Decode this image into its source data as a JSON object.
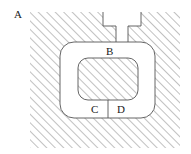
{
  "figure": {
    "kind": "engineering-cross-section-diagram",
    "canvas": {
      "width": 191,
      "height": 154
    },
    "background_color": "#ffffff",
    "line_color": "#555555",
    "hatch_color": "#8c8c8c",
    "text_color": "#1a1a1a",
    "labels": {
      "a": "A",
      "b": "B",
      "c": "C",
      "d": "D"
    },
    "regions": {
      "outer_hatched_block": {
        "name": "A",
        "x": 30,
        "y": 12,
        "width": 150,
        "height": 136,
        "fill": "diagonal-hatch-45"
      },
      "outer_rounded_cavity": {
        "name": "B",
        "x": 60,
        "y": 42,
        "width": 95,
        "height": 76,
        "corner_radius": 14,
        "fill": "white"
      },
      "inner_hatched_core": {
        "x": 78,
        "y": 58,
        "width": 60,
        "height": 42,
        "corner_radius": 10,
        "fill": "diagonal-hatch-45"
      },
      "lower_left_cell": {
        "name": "C"
      },
      "lower_right_cell": {
        "name": "D"
      }
    },
    "features": {
      "top_channel": {
        "description": "white vertical channel between two mirrored stepped notches",
        "left_x": 116,
        "right_x": 128,
        "top_y": 12,
        "bottom_y": 42
      },
      "left_step_notch": {
        "outer_x": 103,
        "inner_x": 116,
        "top_y": 12,
        "step_y": 26
      },
      "right_step_notch": {
        "outer_x": 141,
        "inner_x": 128,
        "top_y": 12,
        "step_y": 26
      },
      "cd_divider": {
        "x": 108,
        "top_y": 100,
        "bottom_y": 118
      }
    }
  }
}
